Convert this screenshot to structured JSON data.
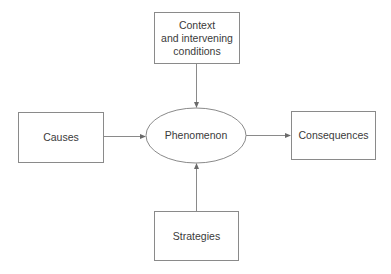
{
  "diagram": {
    "type": "paradigm-model",
    "nodes": {
      "context": {
        "label": "Context\nand intervening\nconditions",
        "line1": "Context",
        "line2": "and intervening",
        "line3": "conditions",
        "shape": "rectangle"
      },
      "causes": {
        "label": "Causes",
        "shape": "rectangle"
      },
      "phenomenon": {
        "label": "Phenomenon",
        "shape": "ellipse"
      },
      "consequences": {
        "label": "Consequences",
        "shape": "rectangle"
      },
      "strategies": {
        "label": "Strategies",
        "shape": "rectangle"
      }
    },
    "edges": [
      {
        "from": "context",
        "to": "phenomenon"
      },
      {
        "from": "causes",
        "to": "phenomenon"
      },
      {
        "from": "strategies",
        "to": "phenomenon"
      },
      {
        "from": "phenomenon",
        "to": "consequences"
      }
    ],
    "colors": {
      "stroke": "#8a8a8a",
      "text": "#3a3a3a",
      "background": "#ffffff"
    }
  }
}
